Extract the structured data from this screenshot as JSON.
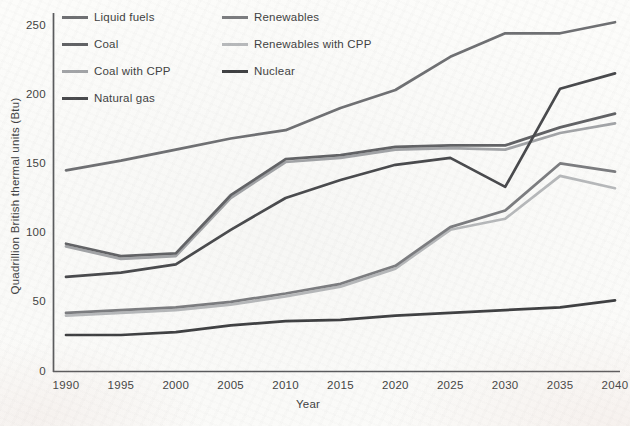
{
  "figure": {
    "y_axis_title": "Quadrillion British thermal units (Btu)",
    "x_axis_title": "Year"
  },
  "legend": {
    "columns": [
      [
        "Liquid fuels",
        "Coal",
        "Coal with CPP",
        "Natural gas"
      ],
      [
        "Renewables",
        "Renewables with CPP",
        "Nuclear"
      ]
    ]
  },
  "chart_data": {
    "type": "line",
    "title": "",
    "xlabel": "Year",
    "ylabel": "Quadrillion British thermal units (Btu)",
    "x": [
      1990,
      1995,
      2000,
      2005,
      2010,
      2015,
      2020,
      2025,
      2030,
      2035,
      2040
    ],
    "x_tick_labels": [
      "1990",
      "1995",
      "2000",
      "2005",
      "2010",
      "2015",
      "2020",
      "2025",
      "2030",
      "2035",
      "2040"
    ],
    "y_ticks": [
      250,
      200,
      150,
      100,
      50,
      0
    ],
    "xlim": [
      1990,
      2040
    ],
    "ylim": [
      0,
      250
    ],
    "grid": false,
    "legend_position": "top-left, two columns",
    "series": [
      {
        "name": "Coal with CPP",
        "color": "#a2a4a7",
        "values": [
          90,
          81,
          83,
          125,
          151,
          154,
          160,
          161,
          160,
          172,
          179
        ]
      },
      {
        "name": "Renewables with CPP",
        "color": "#b7b9bb",
        "values": [
          40,
          42,
          44,
          48,
          54,
          61,
          74,
          102,
          110,
          141,
          132
        ]
      },
      {
        "name": "Coal",
        "color": "#606164",
        "values": [
          92,
          83,
          85,
          127,
          153,
          156,
          162,
          163,
          163,
          176,
          186
        ]
      },
      {
        "name": "Renewables",
        "color": "#7b7c7f",
        "values": [
          42,
          44,
          46,
          50,
          56,
          63,
          76,
          104,
          116,
          150,
          144
        ]
      },
      {
        "name": "Liquid fuels",
        "color": "#6e6f72",
        "values": [
          145,
          152,
          160,
          168,
          174,
          190,
          203,
          227,
          244,
          244,
          252
        ]
      },
      {
        "name": "Nuclear",
        "color": "#3d3e40",
        "values": [
          26,
          26,
          28,
          33,
          36,
          37,
          40,
          42,
          44,
          46,
          51
        ]
      },
      {
        "name": "Natural gas",
        "color": "#47484b",
        "values": [
          68,
          71,
          77,
          102,
          125,
          138,
          149,
          154,
          133,
          204,
          215
        ]
      }
    ]
  }
}
